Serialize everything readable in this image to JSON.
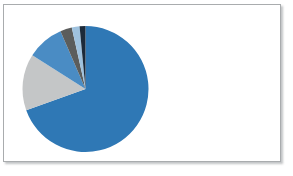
{
  "figure": {
    "title": "",
    "background_color": "#ffffff",
    "border_color": "#a9acae"
  },
  "chart_data": {
    "type": "pie",
    "title": "",
    "xlabel": "",
    "ylabel": "",
    "legend": "none",
    "grid": false,
    "labels_shown": false,
    "start_angle_deg": 0,
    "direction": "clockwise",
    "center": {
      "x": 84.5,
      "y": 88
    },
    "radius": 63,
    "categories": [
      "Series 1",
      "Series 2",
      "Series 3",
      "Series 4",
      "Series 5",
      "Series 6"
    ],
    "values": [
      69.5,
      14.5,
      9.5,
      3.0,
      2.0,
      1.5
    ],
    "percentages": [
      "69.5%",
      "14.5%",
      "9.5%",
      "3.0%",
      "2.0%",
      "1.5%"
    ],
    "colors": [
      "#2f78b5",
      "#c4c6c7",
      "#4a8cc4",
      "#5b5d5c",
      "#9fc2de",
      "#1c2a3a"
    ],
    "slices": [
      {
        "label": "Series 1",
        "value": 69.5,
        "color": "#2f78b5",
        "start_deg": 0,
        "end_deg": 250.2
      },
      {
        "label": "Series 2",
        "value": 14.5,
        "color": "#c4c6c7",
        "start_deg": 250.2,
        "end_deg": 302.4
      },
      {
        "label": "Series 3",
        "value": 9.5,
        "color": "#4a8cc4",
        "start_deg": 302.4,
        "end_deg": 336.6
      },
      {
        "label": "Series 4",
        "value": 3.0,
        "color": "#5b5d5c",
        "start_deg": 336.6,
        "end_deg": 347.4
      },
      {
        "label": "Series 5",
        "value": 2.0,
        "color": "#9fc2de",
        "start_deg": 347.4,
        "end_deg": 354.6
      },
      {
        "label": "Series 6",
        "value": 1.5,
        "color": "#1c2a3a",
        "start_deg": 354.6,
        "end_deg": 360.0
      }
    ]
  }
}
